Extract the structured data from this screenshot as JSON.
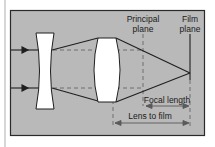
{
  "diagram": {
    "type": "optics-lens-diagram",
    "colors": {
      "background": "#ffffff",
      "panel": "#b9b9b9",
      "panel_border": "#2a2a2a",
      "lens_fill": "#ffffff",
      "ray": "#1f1f1f",
      "dashed_line": "#555555"
    },
    "labels": {
      "principal_plane_line1": "Principal",
      "principal_plane_line2": "plane",
      "film_plane_line1": "Film",
      "film_plane_line2": "plane",
      "focal_length": "Focal length",
      "lens_to_film": "Lens to film"
    },
    "elements": [
      {
        "name": "incoming-ray-top",
        "kind": "ray-with-arrow"
      },
      {
        "name": "incoming-ray-bottom",
        "kind": "ray-with-arrow"
      },
      {
        "name": "diverging-lens",
        "kind": "concave-lens"
      },
      {
        "name": "converging-lens",
        "kind": "convex-lens"
      },
      {
        "name": "principal-plane",
        "kind": "dashed-vertical-line"
      },
      {
        "name": "film-plane",
        "kind": "solid-vertical-line"
      },
      {
        "name": "focal-length-dimension",
        "kind": "double-arrow"
      },
      {
        "name": "lens-to-film-dimension",
        "kind": "double-arrow"
      }
    ]
  }
}
